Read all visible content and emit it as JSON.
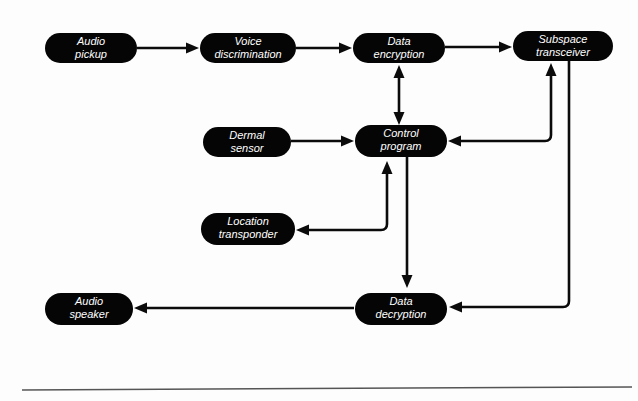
{
  "diagram": {
    "type": "block-flow-diagram",
    "canvas": {
      "width": 638,
      "height": 401
    },
    "colors": {
      "node_fill": "#050505",
      "node_text": "#ffffff",
      "connector": "#0b0b0b",
      "background": "#fdfdfd",
      "rule": "#555555"
    },
    "nodes": [
      {
        "id": "audio-pickup",
        "label": "Audio\npickup",
        "line1": "Audio",
        "line2": "pickup",
        "x": 45,
        "y": 33,
        "w": 92,
        "h": 30
      },
      {
        "id": "voice-discrimination",
        "label": "Voice\ndiscrimination",
        "line1": "Voice",
        "line2": "discrimination",
        "x": 200,
        "y": 33,
        "w": 96,
        "h": 30
      },
      {
        "id": "data-encryption",
        "label": "Data\nencryption",
        "line1": "Data",
        "line2": "encryption",
        "x": 353,
        "y": 33,
        "w": 92,
        "h": 30
      },
      {
        "id": "subspace-transceiver",
        "label": "Subspace\ntransceiver",
        "line1": "Subspace",
        "line2": "transceiver",
        "x": 513,
        "y": 31,
        "w": 100,
        "h": 30
      },
      {
        "id": "dermal-sensor",
        "label": "Dermal\nsensor",
        "line1": "Dermal",
        "line2": "sensor",
        "x": 203,
        "y": 127,
        "w": 88,
        "h": 30
      },
      {
        "id": "control-program",
        "label": "Control\nprogram",
        "line1": "Control",
        "line2": "program",
        "x": 355,
        "y": 125,
        "w": 92,
        "h": 32
      },
      {
        "id": "location-transponder",
        "label": "Location\ntransponder",
        "line1": "Location",
        "line2": "transponder",
        "x": 201,
        "y": 213,
        "w": 94,
        "h": 32
      },
      {
        "id": "data-decryption",
        "label": "Data\ndecryption",
        "line1": "Data",
        "line2": "decryption",
        "x": 355,
        "y": 293,
        "w": 92,
        "h": 32
      },
      {
        "id": "audio-speaker",
        "label": "Audio\nspeaker",
        "line1": "Audio",
        "line2": "speaker",
        "x": 45,
        "y": 293,
        "w": 88,
        "h": 32
      }
    ],
    "edges": [
      {
        "id": "audio-pickup-to-voice-discrimination",
        "from": "audio-pickup",
        "to": "voice-discrimination",
        "arrows": "end",
        "shape": "straight"
      },
      {
        "id": "voice-discrimination-to-data-encryption",
        "from": "voice-discrimination",
        "to": "data-encryption",
        "arrows": "end",
        "shape": "straight"
      },
      {
        "id": "data-encryption-to-subspace-transceiver",
        "from": "data-encryption",
        "to": "subspace-transceiver",
        "arrows": "end",
        "shape": "straight"
      },
      {
        "id": "data-encryption-control-program",
        "from": "data-encryption",
        "to": "control-program",
        "arrows": "both",
        "shape": "straight"
      },
      {
        "id": "dermal-sensor-to-control-program",
        "from": "dermal-sensor",
        "to": "control-program",
        "arrows": "end",
        "shape": "straight"
      },
      {
        "id": "control-program-subspace-transceiver",
        "from": "control-program",
        "to": "subspace-transceiver",
        "arrows": "both",
        "shape": "elbow"
      },
      {
        "id": "control-program-location-transponder",
        "from": "control-program",
        "to": "location-transponder",
        "arrows": "both",
        "shape": "elbow"
      },
      {
        "id": "control-program-to-data-decryption",
        "from": "control-program",
        "to": "data-decryption",
        "arrows": "end",
        "shape": "straight"
      },
      {
        "id": "subspace-transceiver-to-data-decryption",
        "from": "subspace-transceiver",
        "to": "data-decryption",
        "arrows": "end",
        "shape": "elbow"
      },
      {
        "id": "data-decryption-to-audio-speaker",
        "from": "data-decryption",
        "to": "audio-speaker",
        "arrows": "end",
        "shape": "straight"
      }
    ],
    "rule": {
      "id": "bottom-rule",
      "x1": 22,
      "y1": 390,
      "x2": 632,
      "y2": 387
    }
  }
}
